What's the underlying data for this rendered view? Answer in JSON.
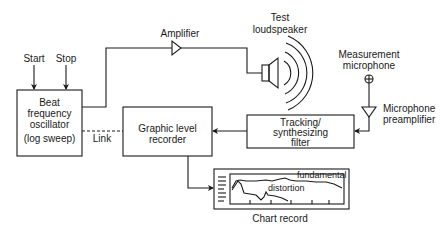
{
  "diagram": {
    "type": "block-diagram",
    "nodes": {
      "start": "Start",
      "stop": "Stop",
      "oscillator": [
        "Beat",
        "frequency",
        "oscillator",
        "(log sweep)"
      ],
      "amplifier": "Amplifier",
      "loudspeaker": [
        "Test",
        "loudspeaker"
      ],
      "microphone": [
        "Measurement",
        "microphone"
      ],
      "preamplifier": [
        "Microphone",
        "preamplifier"
      ],
      "filter": [
        "Tracking/",
        "synthesizing",
        "filter"
      ],
      "recorder": [
        "Graphic level",
        "recorder"
      ],
      "link": "Link",
      "chart_record": "Chart record",
      "trace_fundamental": "fundamental",
      "trace_distortion": "distortion"
    },
    "edges": [
      {
        "from": "start",
        "to": "oscillator"
      },
      {
        "from": "stop",
        "to": "oscillator"
      },
      {
        "from": "oscillator",
        "to": "amplifier"
      },
      {
        "from": "amplifier",
        "to": "loudspeaker"
      },
      {
        "from": "microphone",
        "to": "preamplifier"
      },
      {
        "from": "preamplifier",
        "to": "filter"
      },
      {
        "from": "filter",
        "to": "recorder"
      },
      {
        "from": "oscillator",
        "to": "recorder",
        "style": "dashed",
        "label": "Link"
      },
      {
        "from": "recorder",
        "to": "chart_record"
      }
    ],
    "colors": {
      "line": "#1a1a1a",
      "background": "#ffffff"
    }
  }
}
